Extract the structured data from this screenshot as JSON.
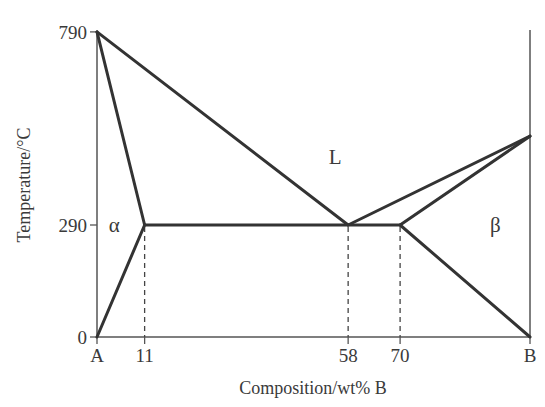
{
  "chart_data": {
    "type": "phase-diagram",
    "title": "",
    "xlabel": "Composition/wt% B",
    "ylabel": "Temperature/°C",
    "xlim": [
      0,
      100
    ],
    "ylim": [
      0,
      790
    ],
    "x_ticks": [
      {
        "value": 0,
        "label": "A"
      },
      {
        "value": 11,
        "label": "11"
      },
      {
        "value": 58,
        "label": "58"
      },
      {
        "value": 70,
        "label": "70"
      },
      {
        "value": 100,
        "label": "B"
      }
    ],
    "y_ticks": [
      {
        "value": 0,
        "label": "0"
      },
      {
        "value": 290,
        "label": "290"
      },
      {
        "value": 790,
        "label": "790"
      }
    ],
    "melting_point_A": 790,
    "melting_point_B": 520,
    "eutectic": {
      "composition": 58,
      "temperature": 290
    },
    "lines": [
      {
        "name": "liquidus-A",
        "points": [
          [
            0,
            790
          ],
          [
            58,
            290
          ]
        ]
      },
      {
        "name": "liquidus-B",
        "points": [
          [
            58,
            290
          ],
          [
            100,
            520
          ]
        ]
      },
      {
        "name": "solidus-alpha",
        "points": [
          [
            0,
            790
          ],
          [
            11,
            290
          ]
        ]
      },
      {
        "name": "solidus-beta",
        "points": [
          [
            70,
            290
          ],
          [
            100,
            520
          ]
        ]
      },
      {
        "name": "eutectic-isotherm",
        "points": [
          [
            11,
            290
          ],
          [
            70,
            290
          ]
        ]
      },
      {
        "name": "solvus-alpha",
        "points": [
          [
            11,
            290
          ],
          [
            0,
            0
          ]
        ]
      },
      {
        "name": "solvus-beta",
        "points": [
          [
            70,
            290
          ],
          [
            100,
            0
          ]
        ]
      }
    ],
    "dashed_guides": [
      11,
      58,
      70
    ],
    "regions": [
      {
        "label": "L",
        "x": 55,
        "y": 465
      },
      {
        "label": "α",
        "x": 4,
        "y": 290
      },
      {
        "label": "β",
        "x": 92,
        "y": 290
      }
    ]
  }
}
